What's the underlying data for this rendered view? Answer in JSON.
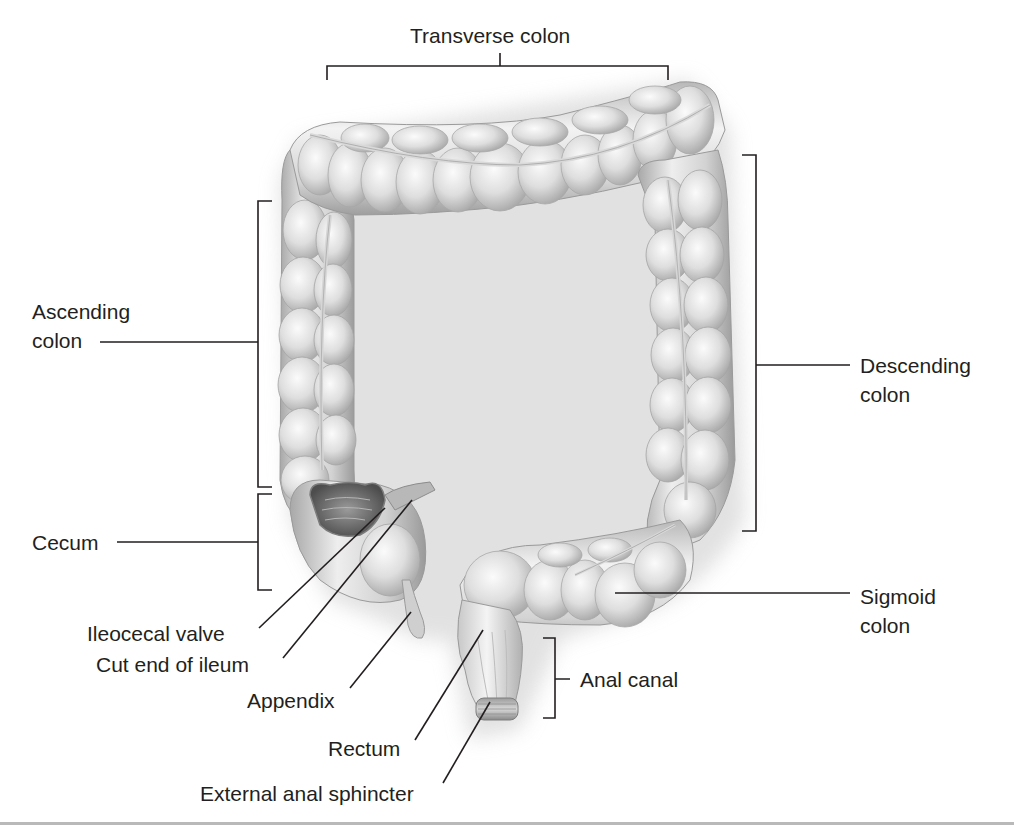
{
  "figure": {
    "labels": {
      "transverse_colon": "Transverse colon",
      "ascending_colon": {
        "line1": "Ascending",
        "line2": "colon"
      },
      "cecum": "Cecum",
      "ileocecal_valve": "Ileocecal valve",
      "cut_end_of_ileum": "Cut end of ileum",
      "appendix": "Appendix",
      "rectum": "Rectum",
      "external_anal_sphincter": "External anal sphincter",
      "anal_canal": "Anal canal",
      "sigmoid_colon": {
        "line1": "Sigmoid",
        "line2": "colon"
      },
      "descending_colon": {
        "line1": "Descending",
        "line2": "colon"
      }
    },
    "colors": {
      "text": "#231f20",
      "leader_line": "#231f20",
      "organ_light": "#f2f2f2",
      "organ_mid": "#cfcfcf",
      "organ_dark": "#8e8e8e",
      "shadow": "#dcdcdc",
      "rule": "#b9b9b9"
    }
  }
}
